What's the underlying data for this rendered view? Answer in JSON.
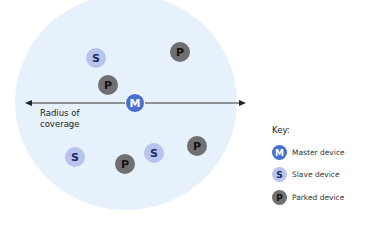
{
  "diagram": {
    "radius_label_lines": [
      "Radius of",
      "coverage"
    ],
    "nodes": [
      {
        "type": "master",
        "letter": "M"
      },
      {
        "type": "slave",
        "letter": "S"
      },
      {
        "type": "slave",
        "letter": "S"
      },
      {
        "type": "slave",
        "letter": "S"
      },
      {
        "type": "parked",
        "letter": "P"
      },
      {
        "type": "parked",
        "letter": "P"
      },
      {
        "type": "parked",
        "letter": "P"
      },
      {
        "type": "parked",
        "letter": "P"
      }
    ],
    "key": {
      "title": "Key:",
      "items": [
        {
          "letter": "M",
          "label": "Master device",
          "type": "master"
        },
        {
          "letter": "S",
          "label": "Slave device",
          "type": "slave"
        },
        {
          "letter": "P",
          "label": "Parked device",
          "type": "parked"
        }
      ]
    },
    "colors": {
      "coverage": "#e6f1fb",
      "master": "#4a6fd0",
      "slave": "#b8c3ee",
      "parked": "#707072"
    }
  }
}
